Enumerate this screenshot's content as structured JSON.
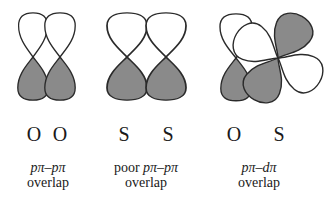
{
  "colors": {
    "positive_lobe": "#ffffff",
    "negative_lobe": "#8a8a8a",
    "outline": "#2a2a2a",
    "text": "#1a1a1a"
  },
  "panels": [
    {
      "atoms": [
        "O",
        "O"
      ],
      "caption_prefix": "",
      "caption_term": "pπ–pπ",
      "caption_suffix": "overlap",
      "orbitals": [
        "p",
        "p"
      ]
    },
    {
      "atoms": [
        "S",
        "S"
      ],
      "caption_prefix": "poor ",
      "caption_term": "pπ–pπ",
      "caption_suffix": "overlap",
      "orbitals": [
        "p",
        "p"
      ]
    },
    {
      "atoms": [
        "O",
        "S"
      ],
      "caption_prefix": "",
      "caption_term": "pπ–dπ",
      "caption_suffix": "overlap",
      "orbitals": [
        "p",
        "d"
      ]
    }
  ]
}
